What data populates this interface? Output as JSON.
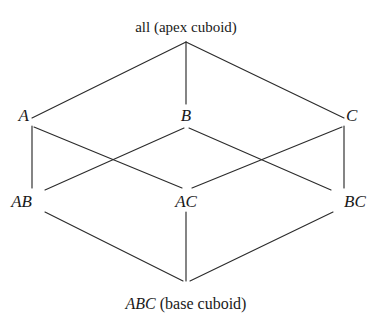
{
  "figure": {
    "background_color": "#ffffff",
    "line_color": "#2b2b2b",
    "text_color": "#1a1a1a"
  },
  "nodes": {
    "apex": {
      "id": "all",
      "symbol": "all",
      "annotation": "(apex cuboid)",
      "full_label": "all (apex cuboid)",
      "style": "roman",
      "level": 0,
      "x": 186,
      "y": 39,
      "label_x": 186,
      "label_y": 20,
      "font_size": 15
    },
    "level1": [
      {
        "id": "A",
        "symbol": "A",
        "style": "italic",
        "level": 1,
        "x": 32,
        "y": 122,
        "label_x": 29,
        "label_y": 107,
        "font_size": 17
      },
      {
        "id": "B",
        "symbol": "B",
        "style": "italic",
        "level": 1,
        "x": 186,
        "y": 122,
        "label_x": 186,
        "label_y": 107,
        "font_size": 17
      },
      {
        "id": "C",
        "symbol": "C",
        "style": "italic",
        "level": 1,
        "x": 344,
        "y": 122,
        "label_x": 346,
        "label_y": 107,
        "font_size": 17
      }
    ],
    "level2": [
      {
        "id": "AB",
        "symbol": "AB",
        "style": "italic",
        "level": 2,
        "x": 40,
        "y": 208,
        "label_x": 32,
        "label_y": 193,
        "font_size": 17
      },
      {
        "id": "AC",
        "symbol": "AC",
        "style": "italic",
        "level": 2,
        "x": 186,
        "y": 208,
        "label_x": 186,
        "label_y": 193,
        "font_size": 17
      },
      {
        "id": "BC",
        "symbol": "BC",
        "style": "italic",
        "level": 2,
        "x": 337,
        "y": 208,
        "label_x": 344,
        "label_y": 193,
        "font_size": 17
      }
    ],
    "base": {
      "id": "ABC",
      "symbol": "ABC",
      "annotation": "(base cuboid)",
      "full_label": "ABC (base cuboid)",
      "style": "italic-plus-roman",
      "level": 3,
      "x": 186,
      "y": 283,
      "label_x": 186,
      "label_y": 296,
      "font_size": 16
    }
  },
  "edges": [
    {
      "from": "all",
      "to": "A",
      "x1": 186,
      "y1": 42,
      "x2": 32,
      "y2": 118
    },
    {
      "from": "all",
      "to": "B",
      "x1": 186,
      "y1": 42,
      "x2": 186,
      "y2": 104
    },
    {
      "from": "all",
      "to": "C",
      "x1": 186,
      "y1": 42,
      "x2": 344,
      "y2": 118
    },
    {
      "from": "A",
      "to": "AB",
      "x1": 32,
      "y1": 126,
      "x2": 32,
      "y2": 188
    },
    {
      "from": "A",
      "to": "AC",
      "x1": 34,
      "y1": 127,
      "x2": 182,
      "y2": 188
    },
    {
      "from": "B",
      "to": "AB",
      "x1": 184,
      "y1": 128,
      "x2": 45,
      "y2": 190
    },
    {
      "from": "B",
      "to": "BC",
      "x1": 189,
      "y1": 128,
      "x2": 331,
      "y2": 190
    },
    {
      "from": "C",
      "to": "AC",
      "x1": 342,
      "y1": 127,
      "x2": 192,
      "y2": 188
    },
    {
      "from": "C",
      "to": "BC",
      "x1": 344,
      "y1": 126,
      "x2": 344,
      "y2": 188
    },
    {
      "from": "AB",
      "to": "ABC",
      "x1": 45,
      "y1": 212,
      "x2": 183,
      "y2": 281
    },
    {
      "from": "AC",
      "to": "ABC",
      "x1": 186,
      "y1": 212,
      "x2": 186,
      "y2": 281
    },
    {
      "from": "BC",
      "to": "ABC",
      "x1": 333,
      "y1": 212,
      "x2": 190,
      "y2": 281
    }
  ],
  "crossings": [
    {
      "x": 115,
      "y": 150,
      "between": "A-AC and B-AB"
    },
    {
      "x": 258,
      "y": 150,
      "between": "C-AC and B-BC"
    }
  ]
}
